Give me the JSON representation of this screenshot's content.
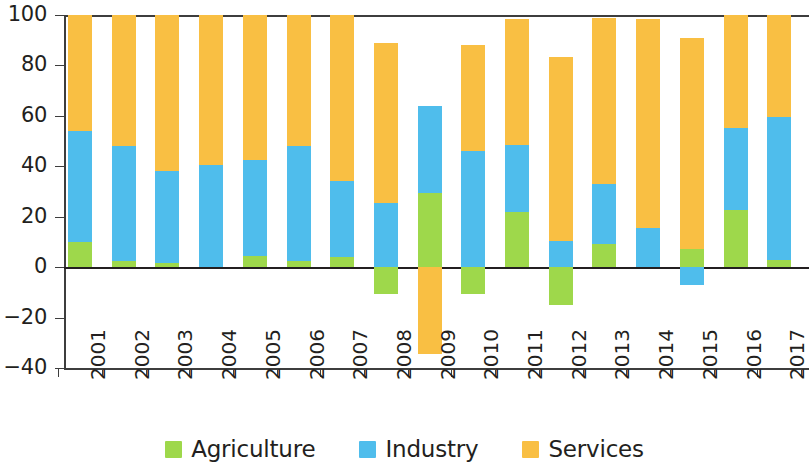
{
  "chart_data": {
    "type": "bar",
    "subtype": "stacked-bar-with-negatives",
    "title": "",
    "subtitle": "",
    "xlabel": "",
    "ylabel": "",
    "categories": [
      "2001",
      "2002",
      "2003",
      "2004",
      "2005",
      "2006",
      "2007",
      "2008",
      "2009",
      "2010",
      "2011",
      "2012",
      "2013",
      "2014",
      "2015",
      "2016",
      "2017"
    ],
    "series": [
      {
        "name": "Agriculture",
        "color": "#9ed84b",
        "values": [
          10,
          2.5,
          1.5,
          0,
          4.5,
          2.5,
          4,
          -10.5,
          29.5,
          -10.5,
          22,
          -15,
          9,
          0,
          7,
          22.5,
          3
        ]
      },
      {
        "name": "Industry",
        "color": "#4fbdec",
        "values": [
          44,
          45.5,
          36.5,
          40.5,
          38,
          45.5,
          30,
          25.5,
          34.5,
          46,
          26.5,
          10.5,
          24,
          15.5,
          -7,
          32.5,
          56.5
        ]
      },
      {
        "name": "Services",
        "color": "#f9bf43",
        "values": [
          46,
          52,
          62,
          59.5,
          57.5,
          52,
          66,
          63.5,
          -34.5,
          42,
          50,
          73,
          66,
          83,
          84,
          45,
          40.5
        ]
      }
    ],
    "stack_totals": [
      100,
      100,
      100,
      100,
      100,
      100,
      100,
      89,
      64,
      88,
      98.5,
      83.5,
      99,
      98.5,
      91,
      100,
      100
    ],
    "yticks": [
      100,
      80,
      60,
      40,
      20,
      0,
      -20,
      -40
    ],
    "ytick_labels": [
      "100",
      "80",
      "60",
      "40",
      "20",
      "0",
      "−20",
      "−40"
    ],
    "ylim": [
      -40,
      100
    ],
    "grid": false,
    "zero_line": true,
    "legend": {
      "position": "bottom-center",
      "entries": [
        {
          "label": "Agriculture",
          "color": "#9ed84b"
        },
        {
          "label": "Industry",
          "color": "#4fbdec"
        },
        {
          "label": "Services",
          "color": "#f9bf43"
        }
      ]
    }
  }
}
